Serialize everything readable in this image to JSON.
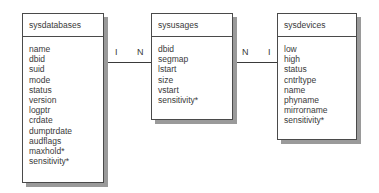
{
  "entities": [
    {
      "name": "sysdatabases",
      "fields": [
        "name",
        "dbid",
        "suid",
        "mode",
        "status",
        "version",
        "logptr",
        "crdate",
        "dumptrdate",
        "audflags",
        "maxhold*",
        "sensitivity*"
      ]
    },
    {
      "name": "sysusages",
      "fields": [
        "dbid",
        "segmap",
        "lstart",
        "size",
        "vstart",
        "sensitivity*"
      ]
    },
    {
      "name": "sysdevices",
      "fields": [
        "low",
        "high",
        "status",
        "cntrltype",
        "name",
        "phyname",
        "mirrorname",
        "sensitivity*"
      ]
    }
  ],
  "relationships": [
    {
      "from": "sysdatabases",
      "to": "sysusages",
      "from_cardinality": "I",
      "to_cardinality": "N"
    },
    {
      "from": "sysusages",
      "to": "sysdevices",
      "from_cardinality": "N",
      "to_cardinality": "I"
    }
  ]
}
